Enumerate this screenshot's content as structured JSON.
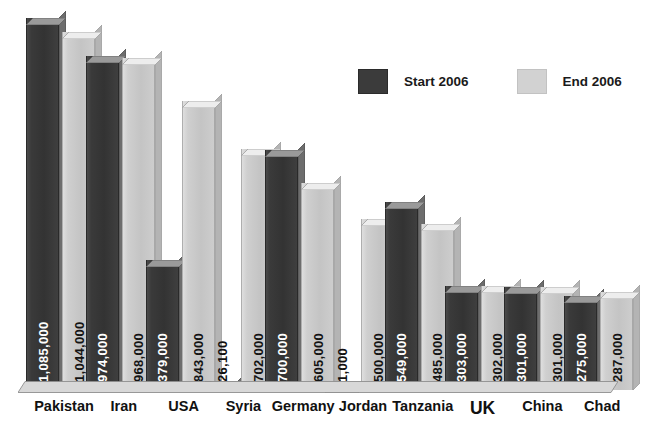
{
  "chart_data": {
    "type": "bar",
    "title": "",
    "subtitle": "",
    "xlabel": "",
    "ylabel": "",
    "grid": false,
    "legend_position": "top-right",
    "ylim": [
      0,
      1085000
    ],
    "categories": [
      "Pakistan",
      "Iran",
      "USA",
      "Syria",
      "Germany",
      "Jordan",
      "Tanzania",
      "UK",
      "China",
      "Chad"
    ],
    "series": [
      {
        "name": "Start 2006",
        "color": "#3a3a3a",
        "values": [
          1085000,
          974000,
          379000,
          26100,
          700000,
          1000,
          549000,
          303000,
          301000,
          275000
        ],
        "labels": [
          "1,085,000",
          "974,000",
          "379,000",
          "26,100",
          "700,000",
          "1,000",
          "549,000",
          "303,000",
          "301,000",
          "275,000"
        ]
      },
      {
        "name": "End 2006",
        "color": "#c8c8c8",
        "values": [
          1044000,
          968000,
          843000,
          702000,
          605000,
          500000,
          485000,
          302000,
          301000,
          287000
        ],
        "labels": [
          "1,044,000",
          "968,000",
          "843,000",
          "702,000",
          "605,000",
          "500,000",
          "485,000",
          "302,000",
          "301,000",
          "287,000"
        ]
      }
    ]
  },
  "legend": {
    "items": [
      {
        "label": "Start 2006",
        "swatch": "dark-swatch"
      },
      {
        "label": "End 2006",
        "swatch": "light-swatch"
      }
    ]
  }
}
